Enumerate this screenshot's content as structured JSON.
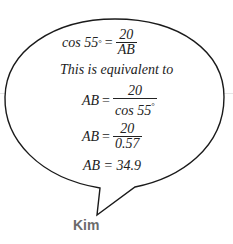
{
  "speaker": "Kim",
  "bubble": {
    "line1": {
      "lhs": "cos 55",
      "degree": "°",
      "eq": "=",
      "num": "20",
      "den": "AB"
    },
    "line2": "This is equivalent to",
    "line3": {
      "lhs": "AB",
      "eq": "=",
      "num": "20",
      "den": "cos 55",
      "degree": "°"
    },
    "line4": {
      "lhs": "AB",
      "eq": "=",
      "num": "20",
      "den": "0.57"
    },
    "line5": "AB = 34.9"
  },
  "colors": {
    "outline": "#1a1a1a",
    "text": "#222222",
    "speaker": "#6b6b6b",
    "guide_line": "#e6e6e6"
  }
}
